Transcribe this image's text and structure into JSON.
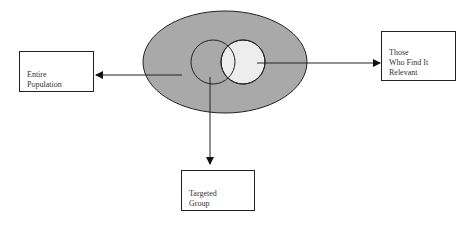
{
  "diagram": {
    "type": "venn-with-labels",
    "colors": {
      "population_fill": "#a9a9a9",
      "targeted_fill": "#a9a9a9",
      "relevant_fill": "#ededed",
      "stroke": "#222222"
    },
    "nodes": [
      {
        "id": "population",
        "label": "Entire\nPopulation"
      },
      {
        "id": "relevant",
        "label": "Those\nWho Find It\nRelevant"
      },
      {
        "id": "targeted",
        "label": "Targeted\nGroup"
      }
    ],
    "edges": [
      {
        "from": "outer-ellipse",
        "to": "population"
      },
      {
        "from": "right-circle",
        "to": "relevant"
      },
      {
        "from": "left-circle",
        "to": "targeted"
      }
    ]
  }
}
